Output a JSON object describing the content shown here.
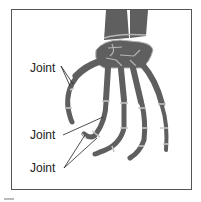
{
  "diagram": {
    "labels": [
      {
        "text": "Joint",
        "x": 30,
        "y": 62
      },
      {
        "text": "Joint",
        "x": 30,
        "y": 129
      },
      {
        "text": "Joint",
        "x": 30,
        "y": 162
      }
    ],
    "colors": {
      "bone": "#5f5f5f",
      "bone_outline": "#b5b5b5",
      "joint_band": "#c8c8c8",
      "frame": "#555555",
      "text": "#222222"
    }
  }
}
